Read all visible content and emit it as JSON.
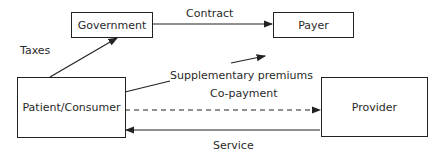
{
  "nodes": {
    "government": "Government",
    "payer": "Payer",
    "patient": "Patient/Consumer",
    "provider": "Provider"
  },
  "edges": {
    "contract": "Contract",
    "taxes": "Taxes",
    "supplementary": "Supplementary premiums",
    "copayment": "Co-payment",
    "service": "Service"
  }
}
